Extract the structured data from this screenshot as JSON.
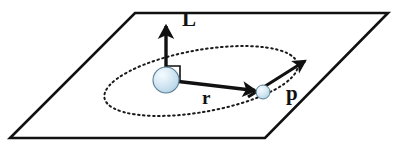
{
  "figure": {
    "background_color": "#ffffff",
    "width": 400,
    "height": 154
  },
  "colors": {
    "stroke": "#111111",
    "plane_edge": "#111111",
    "orbit_dots": "#1a1a1a",
    "sphere_fill_light": "#eaf4fa",
    "sphere_fill_mid": "#cfe4f0",
    "sphere_fill_dark": "#a8cde0",
    "sphere_outline": "#5b7f94",
    "label_color": "#111111"
  },
  "labels": {
    "angular_momentum": "L",
    "radius_vector": "r",
    "momentum": "p"
  },
  "geometry": {
    "plane": {
      "name": "orbital-plane",
      "points": "135,13 388,13 265,138 10,138",
      "stroke_width": 2.6
    },
    "orbit": {
      "name": "orbit-ellipse",
      "center_x": 201,
      "center_y": 81,
      "radius_x": 98,
      "radius_y": 31,
      "rotation_deg": -10,
      "dash": "1.6 3.4",
      "stroke_width": 2.0
    },
    "central_body": {
      "name": "central-mass",
      "cx": 166,
      "cy": 80,
      "r": 13
    },
    "orbiting_body": {
      "name": "orbiting-particle",
      "cx": 263,
      "cy": 92,
      "r": 7
    },
    "vector_L": {
      "x1": 166,
      "y1": 80,
      "x2": 166,
      "y2": 22,
      "stroke_width": 3.4,
      "label_x": 183,
      "label_y": 24
    },
    "vector_r": {
      "x1": 166,
      "y1": 80,
      "x2": 258,
      "y2": 91,
      "stroke_width": 3.4,
      "label_x": 203,
      "label_y": 101
    },
    "vector_p": {
      "x1": 248,
      "y1": 97,
      "x2": 307,
      "y2": 60,
      "stroke_width": 3.2,
      "label_x": 287,
      "label_y": 98
    },
    "right_angle_marker": {
      "name": "right-angle-marker",
      "points": "166,66 180,66 180,80",
      "stroke_width": 1.6
    }
  }
}
